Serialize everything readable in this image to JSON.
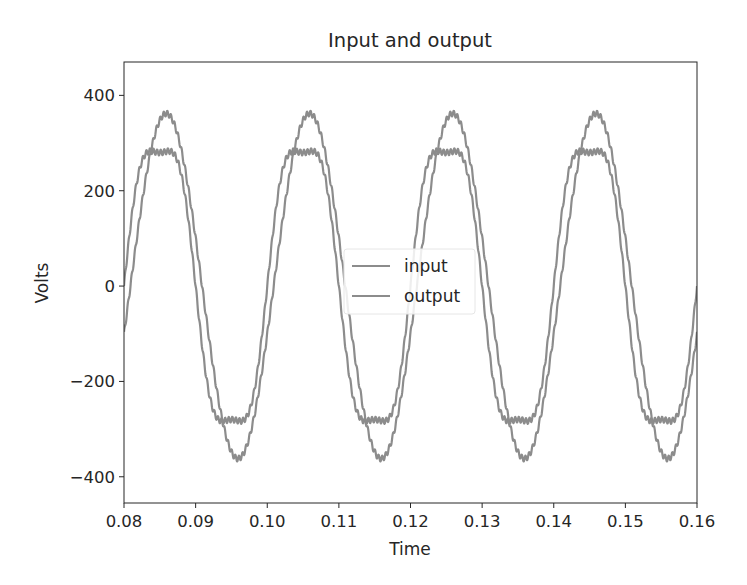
{
  "chart_data": {
    "type": "line",
    "title": "Input and output",
    "xlabel": "Time",
    "ylabel": "Volts",
    "xlim": [
      0.08,
      0.16
    ],
    "ylim": [
      -455,
      470
    ],
    "xticks": [
      0.08,
      0.09,
      0.1,
      0.11,
      0.12,
      0.13,
      0.14,
      0.15,
      0.16
    ],
    "xtick_labels": [
      "0.08",
      "0.09",
      "0.10",
      "0.11",
      "0.12",
      "0.13",
      "0.14",
      "0.15",
      "0.16"
    ],
    "yticks": [
      400,
      200,
      0,
      -200,
      -400
    ],
    "ytick_labels": [
      "400",
      "200",
      "0",
      "−200",
      "−400"
    ],
    "grid": false,
    "legend_position": "center",
    "series": [
      {
        "name": "input",
        "color": "#8c8c8c",
        "model": "325*sin(2*pi*50*t) + 45*sin(2*pi*150*t) + ripple",
        "frequency_hz": 50,
        "fundamental_amplitude": 325,
        "harmonic3_amplitude": 45,
        "phase_lag_s": 0.0,
        "peak": 370,
        "trough": -370,
        "peak_times": [
          0.0845,
          0.1045,
          0.1245,
          0.1445
        ],
        "trough_times": [
          0.0945,
          0.1145,
          0.1345,
          0.1545
        ]
      },
      {
        "name": "output",
        "color": "#8c8c8c",
        "model": "360*sin(2*pi*50*(t-0.0008)) + ripple",
        "frequency_hz": 50,
        "fundamental_amplitude": 362,
        "harmonic3_amplitude": 0,
        "phase_lag_s": 0.0009,
        "peak": 362,
        "trough": -362,
        "peak_times": [
          0.0859,
          0.1059,
          0.1259,
          0.1459
        ],
        "trough_times": [
          0.0959,
          0.1159,
          0.1359,
          0.1559
        ]
      }
    ],
    "ripple": {
      "frequency_hz": 2000,
      "amplitude": 6
    }
  },
  "legend": {
    "items": [
      {
        "label": "input",
        "color": "#8c8c8c"
      },
      {
        "label": "output",
        "color": "#8c8c8c"
      }
    ]
  }
}
